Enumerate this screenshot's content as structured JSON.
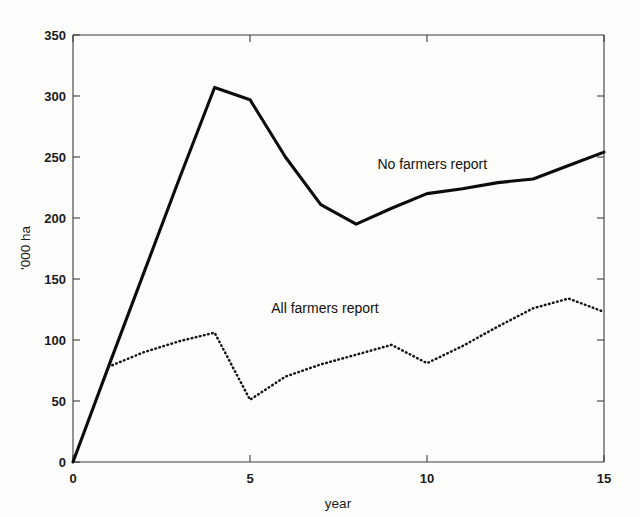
{
  "chart_data": {
    "type": "line",
    "title": "",
    "xlabel": "year",
    "ylabel": "'000 ha",
    "xlim": [
      0,
      15
    ],
    "ylim": [
      0,
      350
    ],
    "xticks": [
      0,
      5,
      10,
      15
    ],
    "xticklabels": [
      "0",
      "5",
      "10",
      "15"
    ],
    "yticks": [
      0,
      50,
      100,
      150,
      200,
      250,
      300,
      350
    ],
    "yticklabels": [
      "0",
      "50",
      "100",
      "150",
      "200",
      "250",
      "300",
      "350"
    ],
    "grid": false,
    "legend_position": "inline-annotation",
    "series": [
      {
        "name": "No farmers report",
        "style": "solid",
        "x": [
          0,
          1,
          2,
          3,
          4,
          5,
          6,
          7,
          8,
          9,
          10,
          11,
          12,
          13,
          14,
          15
        ],
        "values": [
          0,
          78,
          155,
          232,
          307,
          297,
          250,
          211,
          195,
          208,
          220,
          224,
          229,
          232,
          243,
          254
        ],
        "annotation": "No farmers report",
        "annotation_xy": [
          8.6,
          240
        ]
      },
      {
        "name": "All farmers report",
        "style": "dotted",
        "x": [
          1,
          2,
          3,
          4,
          5,
          6,
          7,
          8,
          9,
          10,
          11,
          12,
          13,
          14,
          15
        ],
        "values": [
          78,
          90,
          99,
          106,
          51,
          70,
          80,
          88,
          96,
          81,
          95,
          111,
          126,
          134,
          123
        ],
        "annotation": "All farmers report",
        "annotation_xy": [
          5.6,
          122
        ]
      }
    ]
  },
  "axes": {
    "y_axis_label": "'000 ha",
    "x_axis_label": "year"
  },
  "colors": {
    "line": "#0c0c0c",
    "axis": "#3b3b3b",
    "background": "#fdfdfc",
    "text": "#1a1a1a"
  },
  "tick_labels": {
    "y": [
      "350",
      "300",
      "250",
      "200",
      "150",
      "100",
      "50",
      "0"
    ],
    "x": [
      "0",
      "5",
      "10",
      "15"
    ]
  },
  "annotations": {
    "no_farmers": "No farmers report",
    "all_farmers": "All farmers report"
  }
}
